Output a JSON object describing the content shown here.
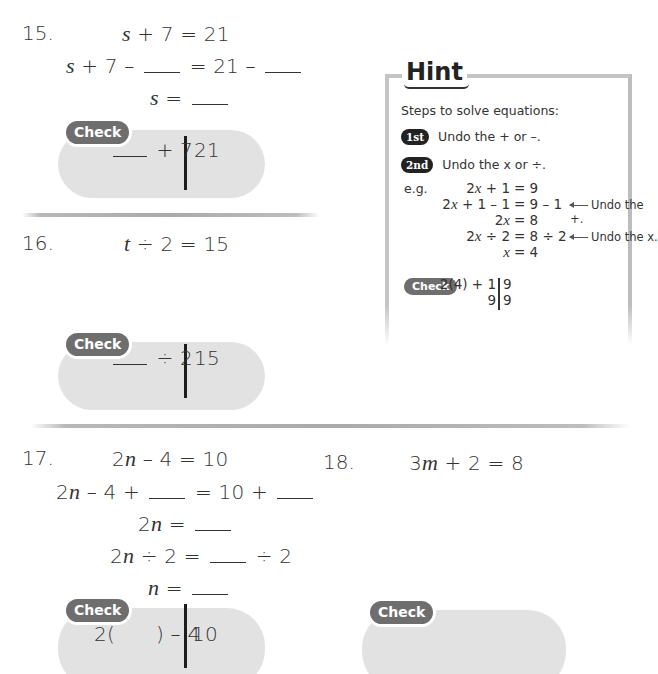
{
  "problems": [
    {
      "number": "15.",
      "equation": {
        "var": "s",
        "rest": " + 7 = 21"
      },
      "steps": [
        {
          "left_var": "s",
          "left_rest": " + 7 –",
          "mid": "= 21 –"
        },
        {
          "var": "s",
          "rest": " ="
        }
      ],
      "check": {
        "badge": "Check",
        "left": "+ 7",
        "right": "21"
      }
    },
    {
      "number": "16.",
      "equation": {
        "var": "t",
        "rest": " ÷ 2 = 15"
      },
      "check": {
        "badge": "Check",
        "left": "÷ 2",
        "right": "15"
      }
    },
    {
      "number": "17.",
      "equation": {
        "pre": "2",
        "var": "n",
        "rest": " – 4 = 10"
      },
      "steps": [
        {
          "pre": "2",
          "var": "n",
          "rest": " – 4 +",
          "mid": "= 10 +"
        },
        {
          "pre": "2",
          "var": "n",
          "rest": " ="
        },
        {
          "pre": "2",
          "var": "n",
          "rest": " ÷ 2 =",
          "tail": "÷ 2"
        },
        {
          "var": "n",
          "rest": " ="
        }
      ],
      "check": {
        "badge": "Check",
        "left_open": "2(",
        "left_close": ") – 4",
        "right": "10"
      }
    },
    {
      "number": "18.",
      "equation": {
        "pre": "3",
        "var": "m",
        "rest": " + 2 = 8"
      },
      "check": {
        "badge": "Check"
      }
    }
  ],
  "hint": {
    "title": "Hint",
    "intro": "Steps to solve equations:",
    "steps": [
      {
        "badge": "1st",
        "text": "Undo the + or –."
      },
      {
        "badge": "2nd",
        "text": "Undo the x or ÷."
      }
    ],
    "example_label": "e.g.",
    "example_lines": [
      {
        "lhs_pre": "2",
        "lhs_var": "x",
        "lhs_rest": " + 1",
        "rhs": "= 9",
        "note": ""
      },
      {
        "lhs_pre": "2",
        "lhs_var": "x",
        "lhs_rest": " + 1 – 1",
        "rhs": "= 9 – 1",
        "note": "Undo the +."
      },
      {
        "lhs_pre": "2",
        "lhs_var": "x",
        "lhs_rest": "",
        "rhs": "= 8",
        "note": ""
      },
      {
        "lhs_pre": "2",
        "lhs_var": "x",
        "lhs_rest": " ÷ 2",
        "rhs": "= 8 ÷ 2",
        "note": "Undo the x."
      },
      {
        "lhs_pre": "",
        "lhs_var": "x",
        "lhs_rest": "",
        "rhs": "= 4",
        "note": ""
      }
    ],
    "check": {
      "badge": "Check",
      "row1_left": "2(4) + 1",
      "row1_right": "9",
      "row2_left": "9",
      "row2_right": "9"
    }
  }
}
